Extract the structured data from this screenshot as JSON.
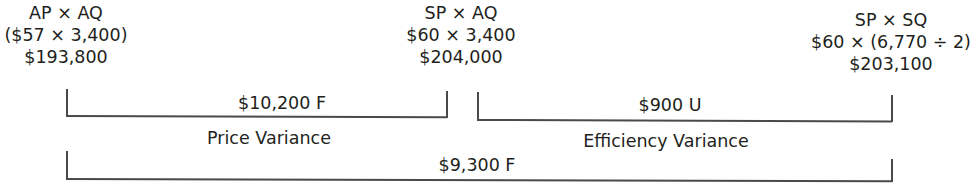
{
  "diagram": {
    "type": "variance-analysis",
    "colors": {
      "text": "#231f20",
      "lines": "#4a4a4a",
      "background": "#ffffff"
    },
    "columns": [
      {
        "formula": "AP × AQ",
        "computation": "($57 × 3,400)",
        "result": "$193,800"
      },
      {
        "formula": "SP × AQ",
        "computation": "$60 × 3,400",
        "result": "$204,000"
      },
      {
        "formula": "SP × SQ",
        "computation": "$60 × (6,770 ÷ 2)",
        "result": "$203,100"
      }
    ],
    "variances": [
      {
        "amount": "$10,200 F",
        "name": "Price Variance",
        "between": [
          0,
          1
        ]
      },
      {
        "amount": "$900 U",
        "name": "Efficiency Variance",
        "between": [
          1,
          2
        ]
      }
    ],
    "total_variance": {
      "amount": "$9,300 F",
      "between": [
        0,
        2
      ]
    }
  }
}
